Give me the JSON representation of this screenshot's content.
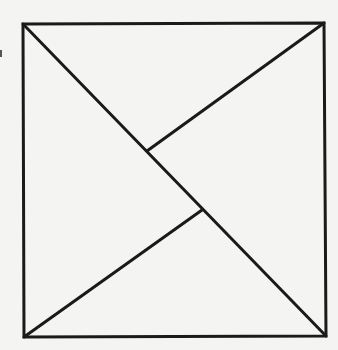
{
  "diagram": {
    "background": "#f4f4f2",
    "stroke_color": "#1a1a1a",
    "stroke_width": 3,
    "square": {
      "top_left": [
        23,
        24
      ],
      "top_right": [
        324,
        23
      ],
      "bottom_right": [
        326,
        336
      ],
      "bottom_left": [
        24,
        337
      ]
    },
    "segments": [
      {
        "name": "main-diagonal",
        "from": [
          23,
          24
        ],
        "to": [
          326,
          336
        ]
      },
      {
        "name": "upper-segment",
        "from": [
          324,
          23
        ],
        "to": [
          147,
          151
        ]
      },
      {
        "name": "lower-segment",
        "from": [
          24,
          337
        ],
        "to": [
          202,
          210
        ]
      }
    ],
    "artifact_mark": {
      "x": 0,
      "y": 50,
      "w": 2,
      "h": 7,
      "color": "#555555"
    }
  }
}
